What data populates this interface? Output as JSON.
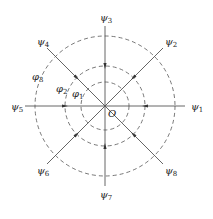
{
  "diagram": {
    "title": "",
    "center_label": "O",
    "rays": [
      {
        "id": "psi1",
        "symbol": "ψ",
        "subscript": "1",
        "direction_deg": 0
      },
      {
        "id": "psi2",
        "symbol": "ψ",
        "subscript": "2",
        "direction_deg": 45
      },
      {
        "id": "psi3",
        "symbol": "ψ",
        "subscript": "3",
        "direction_deg": 90
      },
      {
        "id": "psi4",
        "symbol": "ψ",
        "subscript": "4",
        "direction_deg": 135
      },
      {
        "id": "psi5",
        "symbol": "ψ",
        "subscript": "5",
        "direction_deg": 180
      },
      {
        "id": "psi6",
        "symbol": "ψ",
        "subscript": "6",
        "direction_deg": 225
      },
      {
        "id": "psi7",
        "symbol": "ψ",
        "subscript": "7",
        "direction_deg": 270
      },
      {
        "id": "psi8",
        "symbol": "ψ",
        "subscript": "8",
        "direction_deg": 315
      }
    ],
    "circles": [
      {
        "id": "phi1",
        "symbol": "φ",
        "subscript": "1",
        "rank": 1
      },
      {
        "id": "phi2",
        "symbol": "φ",
        "subscript": "2",
        "rank": 2
      },
      {
        "id": "phi3",
        "symbol": "φ",
        "subscript": "3",
        "rank": 3
      }
    ],
    "arrow_direction": "inward toward O",
    "colors": {
      "line": "#555555",
      "text": "#222222"
    }
  }
}
